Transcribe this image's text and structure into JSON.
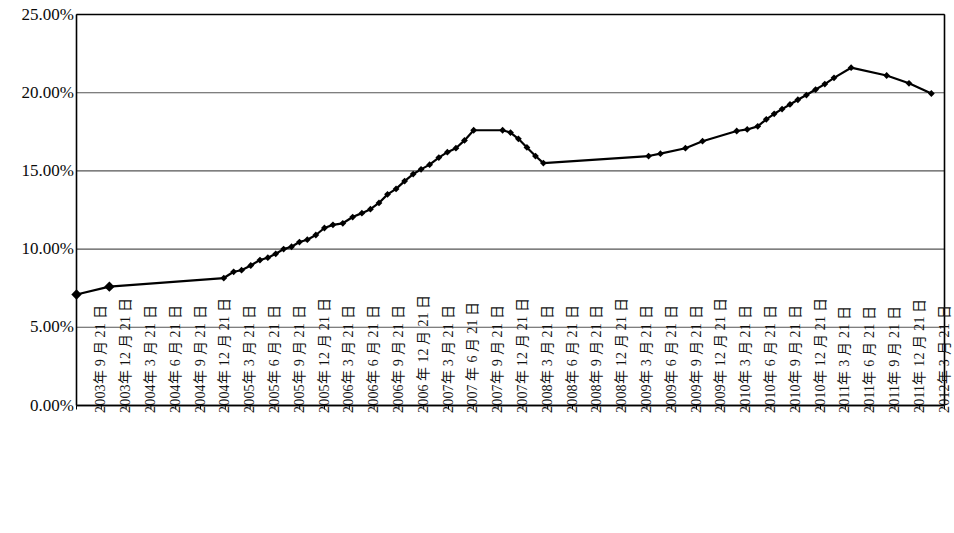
{
  "chart_data": {
    "type": "line",
    "title": "",
    "subtitle": "",
    "xlabel": "",
    "ylabel": "",
    "ylim": [
      0,
      25
    ],
    "ytick_labels": [
      "0.00%",
      "5.00%",
      "10.00%",
      "15.00%",
      "20.00%",
      "25.00%"
    ],
    "ytick_values": [
      0,
      5,
      10,
      15,
      20,
      25
    ],
    "grid": "horizontal",
    "legend": "none",
    "marker": "diamond",
    "line_color": "#000000",
    "marker_color": "#000000",
    "axis_color": "#000000",
    "grid_color": "#555555",
    "background": "#ffffff",
    "categories": [
      "2003年 9 月 21 日",
      "2003年 12 月 21 日",
      "2004年 3 月 21 日",
      "2004年 6 月 21 日",
      "2004年 9 月 21 日",
      "2004年 12 月 21 日",
      "2005年 3 月 21 日",
      "2005年 6 月 21 日",
      "2005年 9 月 21 日",
      "2005年 12 月 21 日",
      "2006年 3 月 21 日",
      "2006年 6 月 21 日",
      "2006年 9 月 21 日",
      "2006 年 12 月 21 日",
      "2007年 3 月 21 日",
      "2007 年 6 月 21 日",
      "2007年 9 月 21 日",
      "2007年 12 月 21 日",
      "2008年 3 月 21 日",
      "2008年 6 月 21 日",
      "2008年 9 月 21 日",
      "2008年 12 月 21 日",
      "2009年 3 月 21 日",
      "2009年 6 月 21 日",
      "2009年 9 月 21 日",
      "2009年 12 月 21 日",
      "2010年 3 月 21 日",
      "2010年 6 月 21 日",
      "2010年 9 月 21 日",
      "2010年 12 月 21 日",
      "2011年 3 月 21 日",
      "2011年 6 月 21 日",
      "2011年 9 月 21 日",
      "2011年 12 月 21 日",
      "2012年 3 月 21 日"
    ],
    "points": [
      {
        "x": 0.0,
        "y": 7.1,
        "marker": true
      },
      {
        "x": 2.5,
        "y": 7.6,
        "marker": true
      },
      {
        "x": 11.2,
        "y": 8.15,
        "marker": true
      },
      {
        "x": 11.95,
        "y": 8.55,
        "marker": true
      },
      {
        "x": 12.55,
        "y": 8.65,
        "marker": true
      },
      {
        "x": 13.25,
        "y": 8.95,
        "marker": true
      },
      {
        "x": 13.95,
        "y": 9.3,
        "marker": true
      },
      {
        "x": 14.55,
        "y": 9.45,
        "marker": true
      },
      {
        "x": 15.15,
        "y": 9.7,
        "marker": true
      },
      {
        "x": 15.75,
        "y": 10.0,
        "marker": true
      },
      {
        "x": 16.35,
        "y": 10.15,
        "marker": true
      },
      {
        "x": 16.95,
        "y": 10.45,
        "marker": true
      },
      {
        "x": 17.55,
        "y": 10.6,
        "marker": true
      },
      {
        "x": 18.2,
        "y": 10.9,
        "marker": true
      },
      {
        "x": 18.85,
        "y": 11.35,
        "marker": true
      },
      {
        "x": 19.5,
        "y": 11.55,
        "marker": true
      },
      {
        "x": 20.25,
        "y": 11.65,
        "marker": true
      },
      {
        "x": 21.0,
        "y": 12.05,
        "marker": true
      },
      {
        "x": 21.7,
        "y": 12.3,
        "marker": true
      },
      {
        "x": 22.35,
        "y": 12.55,
        "marker": true
      },
      {
        "x": 23.0,
        "y": 12.95,
        "marker": true
      },
      {
        "x": 23.65,
        "y": 13.5,
        "marker": true
      },
      {
        "x": 24.3,
        "y": 13.85,
        "marker": true
      },
      {
        "x": 24.95,
        "y": 14.35,
        "marker": true
      },
      {
        "x": 25.6,
        "y": 14.8,
        "marker": true
      },
      {
        "x": 26.2,
        "y": 15.1,
        "marker": true
      },
      {
        "x": 26.85,
        "y": 15.4,
        "marker": true
      },
      {
        "x": 27.55,
        "y": 15.85,
        "marker": true
      },
      {
        "x": 28.2,
        "y": 16.2,
        "marker": true
      },
      {
        "x": 28.85,
        "y": 16.45,
        "marker": true
      },
      {
        "x": 29.5,
        "y": 16.95,
        "marker": true
      },
      {
        "x": 30.2,
        "y": 17.6,
        "marker": true
      },
      {
        "x": 32.4,
        "y": 17.6,
        "marker": true
      },
      {
        "x": 33.0,
        "y": 17.45,
        "marker": true
      },
      {
        "x": 33.6,
        "y": 17.05,
        "marker": true
      },
      {
        "x": 34.25,
        "y": 16.5,
        "marker": true
      },
      {
        "x": 34.9,
        "y": 15.95,
        "marker": true
      },
      {
        "x": 35.5,
        "y": 15.5,
        "marker": true
      },
      {
        "x": 43.5,
        "y": 15.95,
        "marker": true
      },
      {
        "x": 44.4,
        "y": 16.1,
        "marker": true
      },
      {
        "x": 46.3,
        "y": 16.45,
        "marker": true
      },
      {
        "x": 47.6,
        "y": 16.9,
        "marker": true
      },
      {
        "x": 50.2,
        "y": 17.55,
        "marker": true
      },
      {
        "x": 51.0,
        "y": 17.65,
        "marker": true
      },
      {
        "x": 51.8,
        "y": 17.85,
        "marker": true
      },
      {
        "x": 52.45,
        "y": 18.3,
        "marker": true
      },
      {
        "x": 53.05,
        "y": 18.65,
        "marker": true
      },
      {
        "x": 53.65,
        "y": 18.95,
        "marker": true
      },
      {
        "x": 54.25,
        "y": 19.25,
        "marker": true
      },
      {
        "x": 54.85,
        "y": 19.55,
        "marker": true
      },
      {
        "x": 55.5,
        "y": 19.85,
        "marker": true
      },
      {
        "x": 56.2,
        "y": 20.2,
        "marker": true
      },
      {
        "x": 56.9,
        "y": 20.55,
        "marker": true
      },
      {
        "x": 57.6,
        "y": 20.95,
        "marker": true
      },
      {
        "x": 58.9,
        "y": 21.6,
        "marker": true
      },
      {
        "x": 61.6,
        "y": 21.1,
        "marker": true
      },
      {
        "x": 63.3,
        "y": 20.6,
        "marker": true
      },
      {
        "x": 65.0,
        "y": 19.95,
        "marker": true
      }
    ]
  }
}
